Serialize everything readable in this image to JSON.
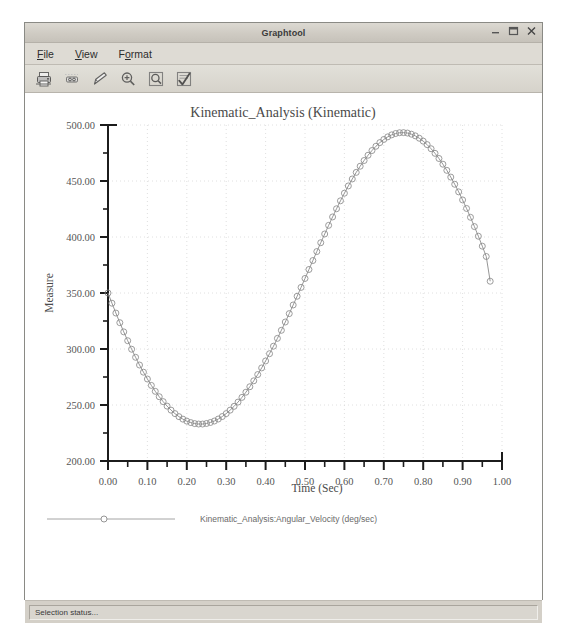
{
  "window": {
    "title": "Graphtool",
    "controls": [
      {
        "name": "minimize-button",
        "glyph": "minimize"
      },
      {
        "name": "maximize-button",
        "glyph": "maximize"
      },
      {
        "name": "close-button",
        "glyph": "close"
      }
    ]
  },
  "menu": {
    "items": [
      {
        "label": "File",
        "mnemonic": "F"
      },
      {
        "label": "View",
        "mnemonic": "V"
      },
      {
        "label": "Format",
        "mnemonic": "o"
      }
    ]
  },
  "toolbar": {
    "buttons": [
      {
        "icon": "print-icon",
        "tooltip": "Print"
      },
      {
        "icon": "page-setup-icon",
        "tooltip": "Page Setup"
      },
      {
        "icon": "edit-pencil-icon",
        "tooltip": "Edit"
      },
      {
        "icon": "zoom-in-icon",
        "tooltip": "Zoom In"
      },
      {
        "icon": "zoom-window-icon",
        "tooltip": "Zoom Window"
      },
      {
        "icon": "checklist-icon",
        "tooltip": "Select Curves"
      }
    ]
  },
  "status": {
    "text": "Selection status..."
  },
  "chart_data": {
    "type": "line",
    "title": "Kinematic_Analysis (Kinematic)",
    "xlabel": "Time (Sec)",
    "ylabel": "Measure",
    "xlim": [
      0.0,
      1.0
    ],
    "ylim": [
      200.0,
      500.0
    ],
    "xticks": [
      "0.00",
      "0.10",
      "0.20",
      "0.30",
      "0.40",
      "0.50",
      "0.60",
      "0.70",
      "0.80",
      "0.90",
      "1.00"
    ],
    "xtick_values": [
      0.0,
      0.1,
      0.2,
      0.3,
      0.4,
      0.5,
      0.6,
      0.7,
      0.8,
      0.9,
      1.0
    ],
    "yticks": [
      "200.00",
      "250.00",
      "300.00",
      "350.00",
      "400.00",
      "450.00",
      "500.00"
    ],
    "ytick_values": [
      200,
      250,
      300,
      350,
      400,
      450,
      500
    ],
    "minor_ticks_per_interval": 2,
    "grid": true,
    "grid_style": "dotted",
    "grid_color": "#d8d8d8",
    "line_color": "#808080",
    "marker": "circle-open",
    "marker_size": 3,
    "legend_position": "bottom",
    "series": [
      {
        "name": "Kinematic_Analysis:Angular_Velocity (deg/sec)",
        "x": [
          0.0,
          0.01,
          0.02,
          0.03,
          0.04,
          0.05,
          0.06,
          0.07,
          0.08,
          0.09,
          0.1,
          0.11,
          0.12,
          0.13,
          0.14,
          0.15,
          0.16,
          0.17,
          0.18,
          0.19,
          0.2,
          0.21,
          0.22,
          0.23,
          0.24,
          0.25,
          0.26,
          0.27,
          0.28,
          0.29,
          0.3,
          0.31,
          0.32,
          0.33,
          0.34,
          0.35,
          0.36,
          0.37,
          0.38,
          0.39,
          0.4,
          0.41,
          0.42,
          0.43,
          0.44,
          0.45,
          0.46,
          0.47,
          0.48,
          0.49,
          0.5,
          0.51,
          0.52,
          0.53,
          0.54,
          0.55,
          0.56,
          0.57,
          0.58,
          0.59,
          0.6,
          0.61,
          0.62,
          0.63,
          0.64,
          0.65,
          0.66,
          0.67,
          0.68,
          0.69,
          0.7,
          0.71,
          0.72,
          0.73,
          0.74,
          0.75,
          0.76,
          0.77,
          0.78,
          0.79,
          0.8,
          0.81,
          0.82,
          0.83,
          0.84,
          0.85,
          0.86,
          0.87,
          0.88,
          0.89,
          0.9,
          0.91,
          0.92,
          0.93,
          0.94,
          0.95,
          0.96,
          0.97
        ],
        "y": [
          350.0,
          340.9,
          332.1,
          323.5,
          315.3,
          307.4,
          299.8,
          292.6,
          285.7,
          279.3,
          273.2,
          267.5,
          262.2,
          257.4,
          253.0,
          249.0,
          245.4,
          242.3,
          239.6,
          237.4,
          235.6,
          234.3,
          233.4,
          233.0,
          233.0,
          233.5,
          234.4,
          235.7,
          237.5,
          239.7,
          242.3,
          245.4,
          248.8,
          252.6,
          256.8,
          261.4,
          266.3,
          271.6,
          277.2,
          283.1,
          289.3,
          295.8,
          302.5,
          309.5,
          316.7,
          324.1,
          331.6,
          339.3,
          347.1,
          355.0,
          363.0,
          371.0,
          379.0,
          387.0,
          394.9,
          402.7,
          410.4,
          417.9,
          425.2,
          432.3,
          439.1,
          445.6,
          451.8,
          457.7,
          463.2,
          468.3,
          473.0,
          477.2,
          481.0,
          484.3,
          487.1,
          489.4,
          491.2,
          492.4,
          493.1,
          493.2,
          492.8,
          491.8,
          490.3,
          488.2,
          485.6,
          482.5,
          478.8,
          474.7,
          470.1,
          465.0,
          459.5,
          453.5,
          447.1,
          440.3,
          433.1,
          425.5,
          417.6,
          409.3,
          400.7,
          391.8,
          382.6,
          360.5
        ],
        "y_min": 233.0,
        "y_min_at_x": 0.235,
        "y_max": 493.2,
        "y_max_at_x": 0.745,
        "y_start": 350.0,
        "y_end": 360.5,
        "line_color": "#8a8a8a",
        "marker": "circle-open"
      }
    ]
  }
}
